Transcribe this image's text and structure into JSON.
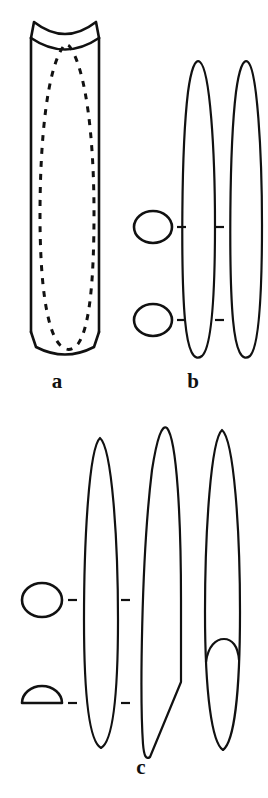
{
  "figure": {
    "background_color": "#ffffff",
    "ink_color": "#111111",
    "width": 268,
    "height": 798,
    "panel_count": 3
  },
  "panels": [
    {
      "id": "a",
      "label": "a",
      "description": "Three-dimensional cylinder with concave saddle top, chamfered rounded base, and dashed internal elongated loop",
      "elements": [
        {
          "name": "cylinder-body",
          "kind": "prism-outline"
        },
        {
          "name": "cylinder-concave-top",
          "kind": "saddle-arc"
        },
        {
          "name": "cylinder-rounded-base",
          "kind": "convex-arc"
        },
        {
          "name": "internal-dashed-loop",
          "kind": "hidden-outline"
        }
      ]
    },
    {
      "id": "b",
      "label": "b",
      "description": "Two circular cross-sections with level tick marks and two narrow elongated longitudinal profiles",
      "elements": [
        {
          "name": "cross-section-circle-upper",
          "kind": "circle"
        },
        {
          "name": "cross-section-circle-lower",
          "kind": "circle"
        },
        {
          "name": "profile-left",
          "kind": "narrow-ellipse"
        },
        {
          "name": "profile-right",
          "kind": "narrow-ellipse"
        }
      ],
      "levels": [
        {
          "name": "upper-level",
          "shape": "circle"
        },
        {
          "name": "lower-level",
          "shape": "circle"
        }
      ]
    },
    {
      "id": "c",
      "label": "c",
      "description": "One circular and one semicircular cross-section with level tick marks, and three elongated longitudinal profiles including an asymmetric wedge and one with an internal cup feature",
      "elements": [
        {
          "name": "cross-section-circle-upper",
          "kind": "circle"
        },
        {
          "name": "cross-section-semicircle-lower",
          "kind": "semicircle"
        },
        {
          "name": "profile-left",
          "kind": "narrow-ellipse"
        },
        {
          "name": "profile-middle-wedge",
          "kind": "asymmetric-wedge"
        },
        {
          "name": "profile-right-with-cup",
          "kind": "ellipse-with-internal-cup"
        }
      ],
      "levels": [
        {
          "name": "upper-level",
          "shape": "circle"
        },
        {
          "name": "lower-level",
          "shape": "semicircle"
        }
      ]
    }
  ]
}
